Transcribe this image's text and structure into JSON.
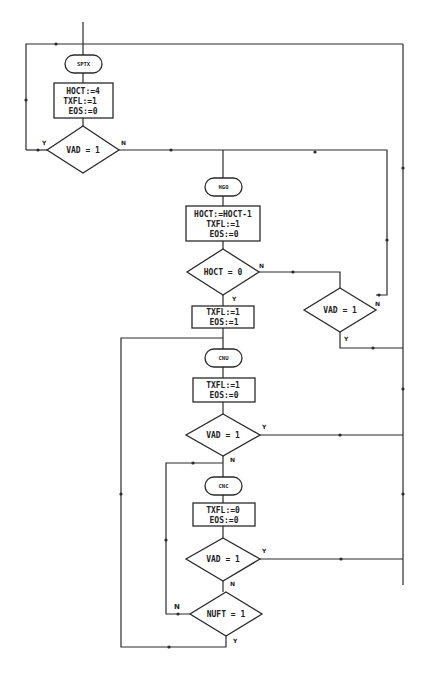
{
  "diagram": {
    "type": "flowchart",
    "terminals": [
      {
        "id": "sptx",
        "label": "SPTX"
      },
      {
        "id": "hgo",
        "label": "HGO"
      },
      {
        "id": "cnu",
        "label": "CNU"
      },
      {
        "id": "cnc",
        "label": "CNC"
      }
    ],
    "processes": [
      {
        "id": "p1",
        "lines": [
          "HOCT:=4",
          "TXFL:=1",
          "EOS:=0"
        ]
      },
      {
        "id": "p2",
        "lines": [
          "HOCT:=HOCT-1",
          "TXFL:=1",
          "EOS:=0"
        ]
      },
      {
        "id": "p3",
        "lines": [
          "TXFL:=1",
          "EOS:=1"
        ]
      },
      {
        "id": "p4",
        "lines": [
          "TXFL:=1",
          "EOS:=0"
        ]
      },
      {
        "id": "p5",
        "lines": [
          "TXFL:=0",
          "EOS:=0"
        ]
      }
    ],
    "decisions": [
      {
        "id": "d1",
        "label": "VAD = 1",
        "yes": "Y",
        "no": "N"
      },
      {
        "id": "d2",
        "label": "HOCT = 0",
        "yes": "Y",
        "no": "N"
      },
      {
        "id": "d3",
        "label": "VAD = 1",
        "yes": "Y",
        "no": "N"
      },
      {
        "id": "d4",
        "label": "VAD = 1",
        "yes": "Y",
        "no": "N"
      },
      {
        "id": "d5",
        "label": "VAD = 1",
        "yes": "Y",
        "no": "N"
      },
      {
        "id": "d6",
        "label": "NUFT = 1",
        "yes": "Y",
        "no": "N"
      }
    ],
    "edges": [
      {
        "from": "start",
        "to": "sptx"
      },
      {
        "from": "sptx",
        "to": "p1"
      },
      {
        "from": "p1",
        "to": "d1"
      },
      {
        "from": "d1",
        "to": "sptx",
        "label": "Y"
      },
      {
        "from": "d1",
        "to": "hgo",
        "label": "N"
      },
      {
        "from": "hgo",
        "to": "p2"
      },
      {
        "from": "p2",
        "to": "d2"
      },
      {
        "from": "d2",
        "to": "p3",
        "label": "Y"
      },
      {
        "from": "d2",
        "to": "d3",
        "label": "N"
      },
      {
        "from": "d3",
        "to": "hgo",
        "label": "N"
      },
      {
        "from": "d3",
        "to": "sptx",
        "label": "Y"
      },
      {
        "from": "p3",
        "to": "cnu"
      },
      {
        "from": "cnu",
        "to": "p4"
      },
      {
        "from": "p4",
        "to": "d4"
      },
      {
        "from": "d4",
        "to": "sptx",
        "label": "Y"
      },
      {
        "from": "d4",
        "to": "cnc",
        "label": "N"
      },
      {
        "from": "cnc",
        "to": "p5"
      },
      {
        "from": "p5",
        "to": "d5"
      },
      {
        "from": "d5",
        "to": "sptx",
        "label": "Y"
      },
      {
        "from": "d5",
        "to": "d6",
        "label": "N"
      },
      {
        "from": "d6",
        "to": "cnc",
        "label": "N"
      },
      {
        "from": "d6",
        "to": "cnu",
        "label": "Y"
      }
    ]
  }
}
